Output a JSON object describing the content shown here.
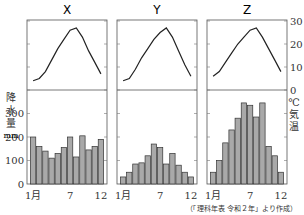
{
  "chart_data": {
    "type": "climograph",
    "panels": [
      {
        "title": "X",
        "temperature_c": [
          4,
          5,
          8,
          13,
          18,
          22,
          26,
          27,
          23,
          17,
          12,
          7
        ],
        "precipitation_mm": [
          200,
          160,
          140,
          110,
          130,
          155,
          200,
          115,
          205,
          145,
          160,
          190
        ]
      },
      {
        "title": "Y",
        "temperature_c": [
          4,
          5,
          9,
          14,
          18,
          22,
          25,
          27,
          23,
          17,
          11,
          6
        ],
        "precipitation_mm": [
          30,
          50,
          85,
          90,
          120,
          170,
          155,
          85,
          130,
          80,
          50,
          30
        ]
      },
      {
        "title": "Z",
        "temperature_c": [
          6,
          8,
          12,
          16,
          20,
          23,
          26,
          27,
          23,
          18,
          13,
          8
        ],
        "precipitation_mm": [
          50,
          100,
          175,
          230,
          280,
          345,
          335,
          285,
          345,
          160,
          120,
          50
        ]
      }
    ],
    "x_tick_labels": [
      "1月",
      "7",
      "12"
    ],
    "left_axis": {
      "label": "降水量 mm",
      "ticks": [
        0,
        100,
        200,
        300
      ],
      "range": [
        0,
        350
      ]
    },
    "right_axis": {
      "label": "℃ 気温",
      "ticks": [
        0,
        10,
        20,
        30
      ],
      "range": [
        0,
        30
      ]
    },
    "source": "（「理科年表 令和２年」より作成）"
  },
  "labels": {
    "precip_label": [
      "降",
      "水",
      "量",
      "mm"
    ],
    "temp_label": [
      "℃",
      "気",
      "温"
    ]
  }
}
